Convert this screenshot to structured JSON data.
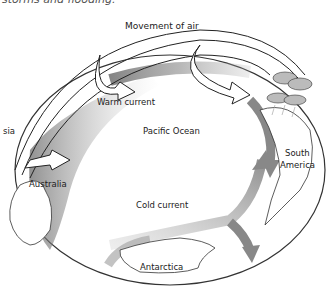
{
  "caption": "storms and flooding.",
  "labels": {
    "movement_of_air": "Movement of air",
    "warm_current": "Warm current",
    "pacific_ocean": "Pacific Ocean",
    "south_america": "South America",
    "south_america_line1": "South",
    "south_america_line2": "America",
    "australia": "Australia",
    "asia_partial": "sia",
    "cold_current": "Cold current",
    "antarctica": "Antarctica"
  },
  "colors": {
    "outline": "#222222",
    "current_gray": "#8a8a8a",
    "land_fill": "#ffffff"
  }
}
